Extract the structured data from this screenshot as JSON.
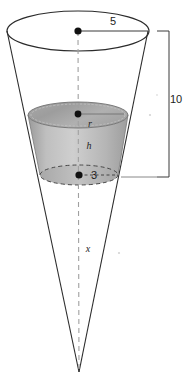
{
  "figure": {
    "background_color": "#ffffff",
    "stroke_color": "#2b2b2b",
    "dashed_axis_color": "#9b9b9b",
    "shade_light": "#cfcfcf",
    "shade_mid": "#b4b4b4",
    "shade_dark": "#8f8f8f",
    "dot_color": "#111111",
    "labels": {
      "top_radius": "5",
      "total_height": "10",
      "liquid_radius": "r",
      "liquid_height": "h",
      "lower_radius": "3",
      "axis_length": "x"
    },
    "artifact_text": "",
    "parts": [
      {
        "name": "cone-outline",
        "label": "cone"
      },
      {
        "name": "top-ellipse",
        "label": "top rim"
      },
      {
        "name": "frustum-shaded",
        "label": "shaded frustum"
      },
      {
        "name": "dimension-bracket",
        "label": "10 bracket"
      },
      {
        "name": "center-axis",
        "label": "dashed axis"
      }
    ]
  }
}
